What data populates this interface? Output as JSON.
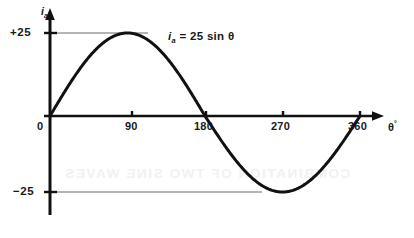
{
  "figure": {
    "background_color": "#ffffff",
    "ink_color": "#111111",
    "helper_line_color": "#6b6b6b",
    "showthrough_text": "COMBINATION OF TWO SINE WAVES",
    "showthrough_color": "#f1f1f1"
  },
  "axes": {
    "y_axis_title": "i",
    "y_axis_title_sub": "a",
    "x_axis_title": "θ",
    "x_axis_title_sup": "°",
    "origin_label": "0"
  },
  "labels": {
    "positive_amplitude": "+25",
    "negative_amplitude": "−25",
    "equation_lead": "i",
    "equation_sub": "a",
    "equation_rest": "= 25 sin θ",
    "equation_full": "iₐ = 25 sin θ"
  },
  "chart_data": {
    "type": "line",
    "title": "",
    "subtitle": "",
    "xlabel": "θ°",
    "ylabel": "iₐ",
    "xlim": [
      0,
      375
    ],
    "ylim": [
      -30,
      30
    ],
    "grid": false,
    "legend": "none",
    "annotations": [
      {
        "text": "iₐ = 25 sin θ",
        "x": 160,
        "y": 20
      },
      {
        "text": "+25",
        "x": 0,
        "y": 25,
        "kind": "axis-value-with-leader-line"
      },
      {
        "text": "−25",
        "x": 0,
        "y": -25,
        "kind": "axis-value-with-leader-line"
      }
    ],
    "xticks": [
      0,
      90,
      180,
      270,
      360
    ],
    "xtick_labels": [
      "0",
      "90",
      "180",
      "270",
      "360"
    ],
    "yticks": [
      25,
      0,
      -25
    ],
    "ytick_labels": [
      "+25",
      "0",
      "−25"
    ],
    "series": [
      {
        "name": "iₐ = 25 sin θ",
        "amplitude": 25,
        "period_degrees": 360,
        "phase_degrees": 0,
        "equation": "i_a = 25 sin(theta)",
        "x": [
          0,
          15,
          30,
          45,
          60,
          75,
          90,
          105,
          120,
          135,
          150,
          165,
          180,
          195,
          210,
          225,
          240,
          255,
          270,
          285,
          300,
          315,
          330,
          345,
          360
        ],
        "values": [
          0,
          6.47,
          12.5,
          17.68,
          21.65,
          24.15,
          25,
          24.15,
          21.65,
          17.68,
          12.5,
          6.47,
          0,
          -6.47,
          -12.5,
          -17.68,
          -21.65,
          -24.15,
          -25,
          -24.15,
          -21.65,
          -17.68,
          -12.5,
          -6.47,
          0
        ]
      }
    ]
  }
}
